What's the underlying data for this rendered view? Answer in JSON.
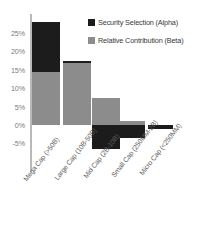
{
  "chart_data": {
    "type": "bar",
    "subtype": "stacked-bar-with-negatives",
    "title": "",
    "xlabel": "",
    "ylabel": "",
    "ylim": [
      -7.5,
      28.5
    ],
    "grid": false,
    "legend_position": "top-right",
    "categories": [
      "Mega Cap (>50B)",
      "Large Cap (10B-50B)",
      "Mid Cap (2B-10B)",
      "Small Cap (250MM-2B)",
      "Micro Cap (<250MM)"
    ],
    "ytick_labels": [
      "25%",
      "20%",
      "15%",
      "10%",
      "5%",
      "0%",
      "-5%"
    ],
    "ytick_values": [
      25,
      20,
      15,
      10,
      5,
      0,
      -5
    ],
    "series": [
      {
        "name": "Security Selection (Alpha)",
        "color": "#1c1c1c",
        "values": [
          13.6,
          0.5,
          -6.5,
          -3.5,
          -1.1
        ]
      },
      {
        "name": "Relative Contribution (Beta)",
        "color": "#8c8c8c",
        "values": [
          14.5,
          16.8,
          7.4,
          1.1,
          0.0
        ]
      }
    ]
  },
  "legend": {
    "items": [
      {
        "label": "Security Selection (Alpha)",
        "swatch": "alpha"
      },
      {
        "label": "Relative Contribution (Beta)",
        "swatch": "beta"
      }
    ]
  }
}
